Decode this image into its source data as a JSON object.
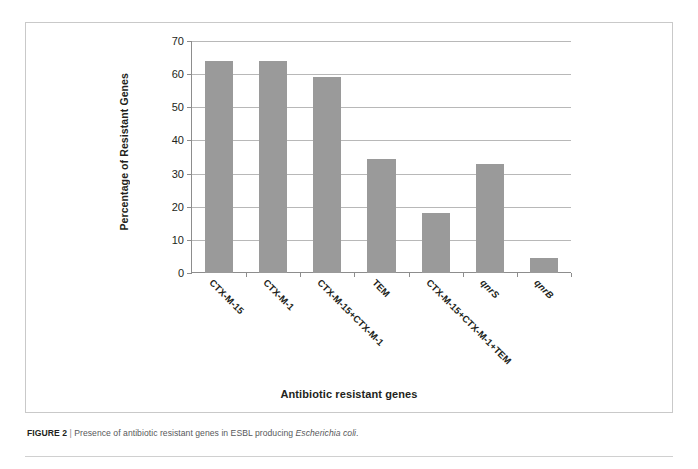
{
  "figure": {
    "caption_number": "FIGURE 2",
    "caption_separator": "|",
    "caption_text_before": "Presence of antibiotic resistant genes in ESBL producing ",
    "caption_species": "Escherichia coli",
    "caption_text_after": "."
  },
  "chart_data": {
    "type": "bar",
    "title": "",
    "xlabel": "Antibiotic resistant genes",
    "ylabel": "Percentage of Resistant Genes",
    "categories": [
      "CTX-M-15",
      "CTX-M-1",
      "CTX-M-15+CTX-M-1",
      "TEM",
      "CTX-M-15+CTX-M-1+TEM",
      "qnrS",
      "qnrB"
    ],
    "category_styles": [
      "normal",
      "normal",
      "normal",
      "normal",
      "normal",
      "italic",
      "italic"
    ],
    "values": [
      64,
      64,
      59,
      34.5,
      18,
      33,
      4.5
    ],
    "ylim": [
      0,
      70
    ],
    "yticks": [
      0,
      10,
      20,
      30,
      40,
      50,
      60,
      70
    ],
    "ytick_labels": [
      "0",
      "10",
      "20",
      "30",
      "40",
      "50",
      "60",
      "70"
    ],
    "grid": true,
    "grid_axis": "y",
    "legend": "none",
    "bar_color": "#9a9a9a",
    "axis_color": "#8d8d8d",
    "grid_color": "#b8b8b8",
    "text_color": "#231f20"
  }
}
